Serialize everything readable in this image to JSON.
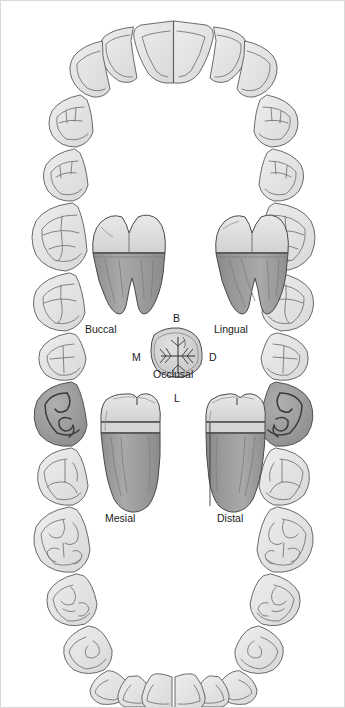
{
  "figure": {
    "background_color": "#ffffff",
    "outline_color": "#555555",
    "enamel_fill": "#e4e4e4",
    "dentin_fill": "#a8a8a8",
    "root_fill": "#9c9c9c",
    "highlight_fill": "#9a9a9a",
    "label_color": "#1a1a1a"
  },
  "view_labels": {
    "buccal": "Buccal",
    "lingual": "Lingual",
    "occlusal": "Occlusal",
    "mesial": "Mesial",
    "distal": "Distal"
  },
  "orientation_labels": {
    "buccal_initial": "B",
    "mesial_initial": "M",
    "distal_initial": "D",
    "lingual_initial": "L"
  },
  "arch": {
    "upper": {
      "name": "maxillary arch",
      "tooth_count": 16,
      "highlighted_indices": []
    },
    "lower": {
      "name": "mandibular arch",
      "tooth_count": 16,
      "highlighted_indices": [
        0,
        15
      ],
      "highlight_note": "mandibular first molars shaded dark"
    }
  },
  "tooth_views": [
    {
      "id": "buccal",
      "label": "Buccal",
      "roots": 2,
      "cusps": 2
    },
    {
      "id": "lingual",
      "label": "Lingual",
      "roots": 2,
      "cusps": 2
    },
    {
      "id": "occlusal",
      "label": "Occlusal",
      "roots": 0,
      "cusps": 5
    },
    {
      "id": "mesial",
      "label": "Mesial",
      "roots": 1,
      "cusps": 2
    },
    {
      "id": "distal",
      "label": "Distal",
      "roots": 1,
      "cusps": 2
    }
  ]
}
